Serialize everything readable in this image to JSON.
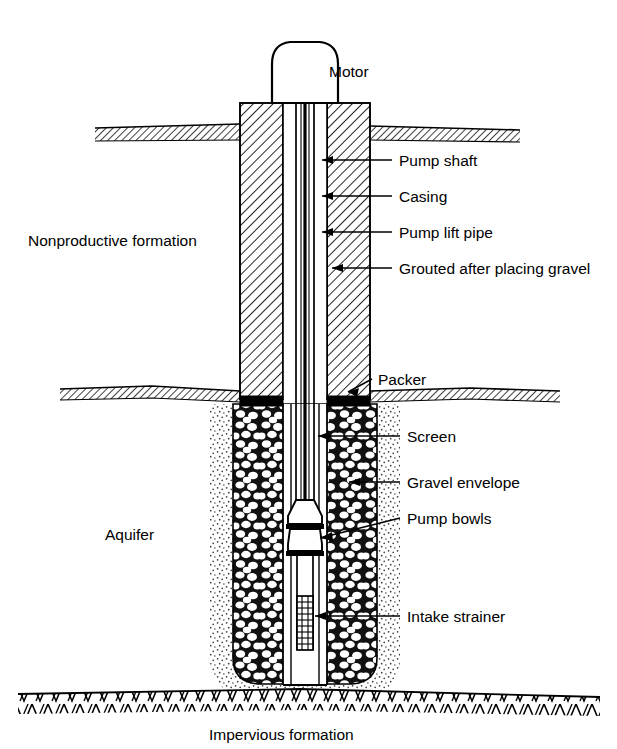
{
  "figure": {
    "background_color": "#ffffff",
    "line_color": "#000000"
  },
  "callout_labels": {
    "motor": "Motor",
    "pump_shaft": "Pump shaft",
    "casing": "Casing",
    "pump_lift_pipe": "Pump lift pipe",
    "grouted": "Grouted after placing gravel",
    "packer": "Packer",
    "screen": "Screen",
    "gravel_envelope": "Gravel envelope",
    "pump_bowls": "Pump bowls",
    "intake_strainer": "Intake strainer"
  },
  "formation_labels": {
    "nonproductive": "Nonproductive formation",
    "aquifer": "Aquifer",
    "impervious": "Impervious formation"
  },
  "colors": {
    "ink": "#000000",
    "paper": "#ffffff",
    "hatch": "#1a1a1a",
    "stipple": "#5a5a5a"
  }
}
